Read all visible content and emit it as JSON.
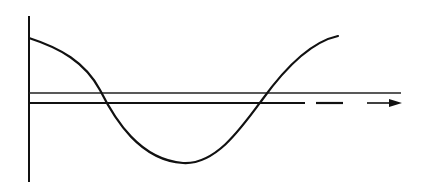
{
  "diagram": {
    "type": "waveform-sketch",
    "colors": {
      "background": "#ffffff",
      "stroke": "#111111"
    },
    "axis": {
      "x": 29,
      "y_top": 16,
      "y_bottom": 182
    },
    "curve": {
      "path": "M29,38 C60,48 85,62 100,90 C115,120 140,160 183,163 C215,165 240,130 262,100 C285,68 310,42 338,36"
    },
    "reference_line_upper": {
      "y": 93,
      "x_start": 29,
      "x_end": 401
    },
    "reference_line_lower": {
      "y": 103,
      "solid": {
        "x_start": 29,
        "x_end": 305
      },
      "dash": {
        "x_start": 316,
        "x_end": 343
      },
      "arrow": {
        "x_start": 367,
        "x_end": 402
      }
    }
  }
}
